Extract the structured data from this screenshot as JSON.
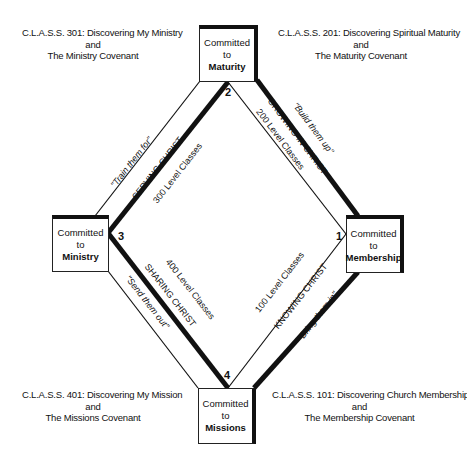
{
  "diagram": {
    "type": "diamond-process",
    "colors": {
      "line": "#111111",
      "background": "#ffffff"
    }
  },
  "nodes": {
    "maturity": {
      "line1": "Committed",
      "line2": "to",
      "line3": "Maturity",
      "number": "2"
    },
    "ministry": {
      "line1": "Committed",
      "line2": "to",
      "line3": "Ministry",
      "number": "3"
    },
    "membership": {
      "line1": "Committed",
      "line2": "to",
      "line3": "Membership",
      "number": "1"
    },
    "missions": {
      "line1": "Committed",
      "line2": "to",
      "line3": "Missions",
      "number": "4"
    }
  },
  "captions": {
    "class301": {
      "line1": "C.L.A.S.S. 301:  Discovering My Ministry",
      "line2": "and",
      "line3": "The Ministry Covenant"
    },
    "class201": {
      "line1": "C.L.A.S.S. 201:  Discovering Spiritual Maturity",
      "line2": "and",
      "line3": "The Maturity Covenant"
    },
    "class401": {
      "line1": "C.L.A.S.S. 401:  Discovering My Mission",
      "line2": "and",
      "line3": "The Missions Covenant"
    },
    "class101": {
      "line1": "C.L.A.S.S. 101:  Discovering Church Membership",
      "line2": "and",
      "line3": "The Membership Covenant"
    }
  },
  "edges": {
    "ministry_maturity": {
      "motto": "\"Train them for\"",
      "theme": "SERVING CHRIST",
      "level": "300 Level Classes"
    },
    "maturity_membership": {
      "motto": "\"Build them up\"",
      "theme": "GROWING IN CHRIST",
      "level": "200 Level Classes"
    },
    "ministry_missions": {
      "motto": "\"Send them out\"",
      "theme": "SHARING CHRIST",
      "level": "400 Level Classes"
    },
    "membership_missions": {
      "motto": "\"Bring them in\"",
      "theme": "KNOWING CHRIST",
      "level": "100 Level Classes"
    }
  }
}
